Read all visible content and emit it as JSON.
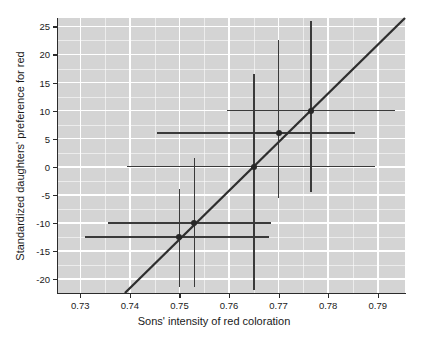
{
  "chart_data": {
    "type": "scatter",
    "title": "",
    "xlabel": "Sons' intensity of red coloration",
    "ylabel": "Standardized daughters' preference for red",
    "xlim": [
      0.7255,
      0.7955
    ],
    "ylim": [
      -22.5,
      26.5
    ],
    "xticks": [
      0.73,
      0.74,
      0.75,
      0.76,
      0.77,
      0.78,
      0.79
    ],
    "xtick_labels": [
      "0.73",
      "0.74",
      "0.75",
      "0.76",
      "0.77",
      "0.78",
      "0.79"
    ],
    "yticks": [
      25,
      20,
      15,
      10,
      5,
      0,
      -5,
      -10,
      -15,
      -20
    ],
    "ytick_labels": [
      "25",
      "20",
      "15",
      "10",
      "5",
      "0",
      "-5",
      "-10",
      "-15",
      "-20"
    ],
    "grid": true,
    "grid_color": "#ffffff",
    "panel_background": "#d4d4d4",
    "legend": null,
    "point_color": "#262626",
    "errorbar_color": "#3a3a3a",
    "line_color": "#2e2e2e",
    "points": [
      {
        "x": 0.75,
        "y": -12.5,
        "xerr_low": 0.731,
        "xerr_high": 0.768,
        "yerr_low": -21.5,
        "yerr_high": -4.0
      },
      {
        "x": 0.753,
        "y": -10.0,
        "xerr_low": 0.7355,
        "xerr_high": 0.7685,
        "yerr_low": -21.5,
        "yerr_high": 1.5
      },
      {
        "x": 0.765,
        "y": 0.0,
        "xerr_low": 0.7395,
        "xerr_high": 0.7895,
        "yerr_low": -22.0,
        "yerr_high": 16.5
      },
      {
        "x": 0.77,
        "y": 6.0,
        "xerr_low": 0.7455,
        "xerr_high": 0.7855,
        "yerr_low": -5.5,
        "yerr_high": 22.5
      },
      {
        "x": 0.7765,
        "y": 10.0,
        "xerr_low": 0.7595,
        "xerr_high": 0.7935,
        "yerr_low": -4.5,
        "yerr_high": 26.0
      }
    ],
    "fit_line": {
      "x_start": 0.739,
      "y_start": -22.5,
      "x_end": 0.7955,
      "y_end": 26.5
    }
  }
}
